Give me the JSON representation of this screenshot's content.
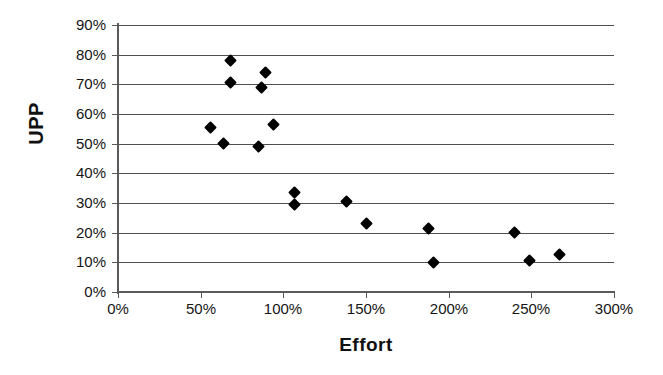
{
  "chart_data": {
    "type": "scatter",
    "title": "",
    "xlabel": "Effort",
    "ylabel": "UPP",
    "xlim": [
      0,
      300
    ],
    "ylim": [
      0,
      90
    ],
    "grid": true,
    "grid_axis": "y",
    "legend": false,
    "legend_position": "none",
    "marker": "black-diamond",
    "x_tick_labels": [
      "0%",
      "50%",
      "100%",
      "150%",
      "200%",
      "250%",
      "300%"
    ],
    "x_tick_values": [
      0,
      50,
      100,
      150,
      200,
      250,
      300
    ],
    "y_tick_labels": [
      "0%",
      "10%",
      "20%",
      "30%",
      "40%",
      "50%",
      "60%",
      "70%",
      "80%",
      "90%"
    ],
    "y_tick_values": [
      0,
      10,
      20,
      30,
      40,
      50,
      60,
      70,
      80,
      90
    ],
    "points": [
      {
        "x": 68,
        "y": 78.0
      },
      {
        "x": 68,
        "y": 70.5
      },
      {
        "x": 89,
        "y": 74.0
      },
      {
        "x": 87,
        "y": 69.0
      },
      {
        "x": 56,
        "y": 55.5
      },
      {
        "x": 94,
        "y": 56.5
      },
      {
        "x": 64,
        "y": 50.0
      },
      {
        "x": 85,
        "y": 49.0
      },
      {
        "x": 107,
        "y": 33.5
      },
      {
        "x": 107,
        "y": 29.5
      },
      {
        "x": 138,
        "y": 30.5
      },
      {
        "x": 150,
        "y": 23.0
      },
      {
        "x": 188,
        "y": 21.5
      },
      {
        "x": 240,
        "y": 20.0
      },
      {
        "x": 191,
        "y": 10.0
      },
      {
        "x": 249,
        "y": 10.5
      },
      {
        "x": 267,
        "y": 12.5
      }
    ]
  },
  "axis": {
    "y_title": "UPP",
    "x_title": "Effort"
  },
  "colors": {
    "marker": "#000000",
    "grid": "#4f4f4f",
    "axis": "#5a5a5a",
    "background": "#ffffff",
    "text": "#151515"
  }
}
